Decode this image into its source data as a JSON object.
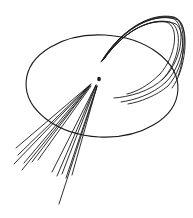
{
  "diagram": {
    "colors": {
      "stroke": "#1a1a1a",
      "background": "#ffffff"
    },
    "ellipse": {
      "cx": 102,
      "cy": 86,
      "rx": 76,
      "ry": 51,
      "rotate": 3
    },
    "vertex": {
      "x": 99,
      "y": 79,
      "r": 1.8
    },
    "jet_left": [
      {
        "x1": 91,
        "y1": 84,
        "x2": 16,
        "y2": 148
      },
      {
        "x1": 91,
        "y1": 84,
        "x2": 18,
        "y2": 155
      },
      {
        "x1": 90,
        "y1": 85,
        "x2": 14,
        "y2": 164
      },
      {
        "x1": 90,
        "y1": 85,
        "x2": 24,
        "y2": 163
      },
      {
        "x1": 90,
        "y1": 86,
        "x2": 22,
        "y2": 170
      },
      {
        "x1": 90,
        "y1": 86,
        "x2": 32,
        "y2": 162
      },
      {
        "x1": 91,
        "y1": 86,
        "x2": 38,
        "y2": 160
      }
    ],
    "jet_down": [
      {
        "x1": 96,
        "y1": 85,
        "x2": 52,
        "y2": 172
      },
      {
        "x1": 96,
        "y1": 85,
        "x2": 57,
        "y2": 176
      },
      {
        "x1": 96,
        "y1": 86,
        "x2": 62,
        "y2": 174
      },
      {
        "x1": 97,
        "y1": 86,
        "x2": 66,
        "y2": 178
      },
      {
        "x1": 97,
        "y1": 86,
        "x2": 72,
        "y2": 175
      },
      {
        "x1": 97,
        "y1": 87,
        "x2": 59,
        "y2": 204
      }
    ],
    "curved_tracks": [
      "M101 62 C 120 30, 150 14, 172 18 C 186 22, 184 58, 164 78 C 150 92, 128 97, 114 98",
      "M102 61 C 122 28, 152 12, 174 17 C 188 22, 186 62, 166 82 C 152 95, 134 100, 121 102",
      "M103 60 C 124 26, 154 12, 176 18 C 190 24, 186 66, 168 86 C 156 96, 140 102, 128 104",
      "M104 59 C 126 24, 158 12, 178 20 C 190 28, 186 70, 172 88",
      "M102 61 C 124 30, 148 20, 166 22 C 180 26, 176 56, 160 74 C 148 86, 136 92, 127 94",
      "M103 60 C 126 28, 152 18, 170 22 C 184 28, 180 62, 162 80",
      "M104 59 C 128 26, 156 16, 176 24 C 186 32, 184 62, 178 76"
    ]
  }
}
